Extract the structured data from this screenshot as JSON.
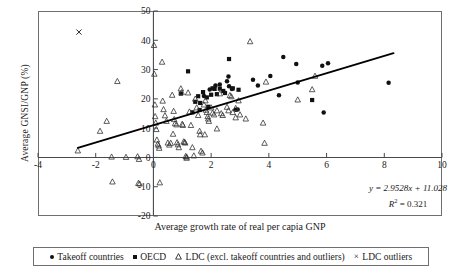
{
  "figure": {
    "y_axis_title": "Average GNSI/GNP (%)",
    "x_axis_title": "Average growth rate of real per capia GNP",
    "equation_line1": "y = 2.9528x + 11.028",
    "equation_r2_label": "R",
    "equation_r2_exp": "2",
    "equation_r2_value": " = 0.321"
  },
  "legend": {
    "items": [
      {
        "marker": "circle",
        "label": "Takeoff countries"
      },
      {
        "marker": "square",
        "label": "OECD"
      },
      {
        "marker": "triangle",
        "label": "LDC (excl. takeoff countries and outliers)"
      },
      {
        "marker": "cross",
        "label": "LDC outliers"
      }
    ]
  },
  "chart_data": {
    "type": "scatter",
    "title": "",
    "xlabel": "Average growth rate of real per capia GNP",
    "ylabel": "Average GNSI/GNP (%)",
    "xlim": [
      -4,
      10
    ],
    "ylim": [
      -20,
      50
    ],
    "xticks": [
      -4,
      -2,
      0,
      2,
      4,
      6,
      8,
      10
    ],
    "yticks": [
      -20,
      -10,
      0,
      10,
      20,
      30,
      40,
      50
    ],
    "xtick_labels": [
      "-4",
      "-2",
      "0",
      "2",
      "4",
      "6",
      "8",
      "10"
    ],
    "ytick_labels": [
      "-20",
      "-10",
      "0",
      "10",
      "20",
      "30",
      "40",
      "50"
    ],
    "grid": false,
    "legend_position": "below",
    "y_axis_at_x": 0,
    "x_axis_at_y": 0,
    "trendline": {
      "equation": "y = 2.9528x + 11.028",
      "slope": 2.9528,
      "intercept": 11.028,
      "r_squared": 0.321,
      "x_start": -2.62,
      "x_end": 8.32
    },
    "series": [
      {
        "name": "Takeoff countries",
        "marker": "filled-circle",
        "points": [
          [
            1.75,
            21.0
          ],
          [
            1.95,
            23.2
          ],
          [
            2.15,
            24.6
          ],
          [
            2.3,
            24.9
          ],
          [
            2.55,
            26.0
          ],
          [
            2.6,
            27.6
          ],
          [
            2.62,
            24.3
          ],
          [
            2.72,
            23.4
          ],
          [
            2.85,
            16.3
          ],
          [
            2.92,
            16.4
          ],
          [
            3.45,
            26.5
          ],
          [
            3.62,
            24.6
          ],
          [
            4.05,
            27.8
          ],
          [
            4.35,
            21.2
          ],
          [
            4.5,
            34.3
          ],
          [
            4.95,
            31.9
          ],
          [
            5.0,
            25.6
          ],
          [
            5.85,
            31.3
          ],
          [
            5.9,
            15.3
          ],
          [
            6.05,
            32.2
          ],
          [
            8.15,
            25.5
          ]
        ]
      },
      {
        "name": "OECD",
        "marker": "filled-square",
        "points": [
          [
            1.2,
            29.4
          ],
          [
            1.55,
            20.9
          ],
          [
            1.6,
            16.2
          ],
          [
            1.62,
            18.6
          ],
          [
            1.72,
            22.3
          ],
          [
            1.85,
            20.5
          ],
          [
            1.9,
            17.3
          ],
          [
            2.0,
            21.4
          ],
          [
            2.05,
            23.6
          ],
          [
            2.12,
            23.4
          ],
          [
            2.2,
            21.6
          ],
          [
            2.3,
            23.5
          ],
          [
            2.42,
            22.7
          ],
          [
            2.48,
            22.0
          ],
          [
            2.62,
            33.6
          ],
          [
            2.75,
            23.6
          ],
          [
            2.95,
            23.1
          ],
          [
            5.5,
            19.6
          ],
          [
            0.95,
            21.8
          ],
          [
            1.35,
            15.4
          ],
          [
            1.45,
            19.0
          ]
        ]
      },
      {
        "name": "LDC (excl. takeoff countries and outliers)",
        "marker": "open-triangle",
        "points": [
          [
            0.02,
            38.3
          ],
          [
            0.03,
            28.5
          ],
          [
            0.05,
            18.0
          ],
          [
            0.06,
            14.0
          ],
          [
            0.08,
            11.8
          ],
          [
            0.1,
            9.6
          ],
          [
            0.12,
            6.0
          ],
          [
            0.15,
            4.6
          ],
          [
            0.18,
            4.0
          ],
          [
            0.2,
            3.2
          ],
          [
            0.3,
            32.6
          ],
          [
            0.32,
            19.3
          ],
          [
            0.35,
            16.4
          ],
          [
            0.4,
            14.3
          ],
          [
            0.45,
            12.4
          ],
          [
            0.5,
            5.0
          ],
          [
            0.55,
            4.3
          ],
          [
            0.6,
            4.9
          ],
          [
            0.65,
            21.3
          ],
          [
            0.7,
            15.8
          ],
          [
            0.72,
            13.0
          ],
          [
            0.75,
            11.6
          ],
          [
            0.8,
            11.2
          ],
          [
            0.82,
            5.1
          ],
          [
            0.85,
            4.4
          ],
          [
            0.88,
            3.4
          ],
          [
            0.95,
            23.5
          ],
          [
            0.98,
            22.2
          ],
          [
            1.0,
            11.4
          ],
          [
            1.02,
            11.0
          ],
          [
            1.05,
            5.4
          ],
          [
            1.08,
            5.2
          ],
          [
            1.1,
            5.0
          ],
          [
            1.12,
            0.4
          ],
          [
            1.15,
            0.2
          ],
          [
            1.2,
            22.1
          ],
          [
            1.25,
            15.6
          ],
          [
            1.3,
            11.0
          ],
          [
            1.35,
            3.4
          ],
          [
            1.4,
            0.6
          ],
          [
            1.45,
            20.0
          ],
          [
            1.5,
            17.0
          ],
          [
            1.55,
            14.4
          ],
          [
            1.6,
            9.0
          ],
          [
            1.62,
            7.8
          ],
          [
            1.65,
            2.2
          ],
          [
            1.7,
            1.6
          ],
          [
            1.75,
            18.0
          ],
          [
            1.8,
            19.4
          ],
          [
            1.82,
            16.2
          ],
          [
            1.85,
            15.4
          ],
          [
            1.88,
            14.0
          ],
          [
            1.9,
            13.2
          ],
          [
            1.92,
            12.4
          ],
          [
            2.0,
            17.0
          ],
          [
            2.05,
            15.2
          ],
          [
            2.1,
            14.6
          ],
          [
            2.2,
            16.0
          ],
          [
            2.3,
            21.8
          ],
          [
            2.35,
            15.0
          ],
          [
            2.4,
            14.4
          ],
          [
            2.55,
            17.2
          ],
          [
            2.6,
            16.0
          ],
          [
            2.65,
            21.2
          ],
          [
            2.7,
            20.8
          ],
          [
            2.75,
            15.4
          ],
          [
            2.85,
            13.6
          ],
          [
            2.95,
            19.4
          ],
          [
            3.0,
            14.6
          ],
          [
            3.2,
            13.2
          ],
          [
            3.35,
            39.6
          ],
          [
            3.8,
            11.8
          ],
          [
            3.85,
            4.9
          ],
          [
            3.9,
            25.8
          ],
          [
            5.0,
            19.7
          ],
          [
            5.5,
            23.2
          ],
          [
            5.6,
            27.8
          ],
          [
            -2.62,
            2.3
          ],
          [
            -1.85,
            9.0
          ],
          [
            -1.62,
            12.4
          ],
          [
            -1.45,
            0.2
          ],
          [
            -1.42,
            -8.3
          ],
          [
            -1.25,
            26.0
          ],
          [
            -0.95,
            0.1
          ],
          [
            -0.55,
            0.3
          ],
          [
            -0.5,
            -0.6
          ],
          [
            -0.52,
            -8.8
          ],
          [
            -0.48,
            -9.0
          ],
          [
            0.22,
            -8.6
          ],
          [
            1.15,
            -0.2
          ],
          [
            2.85,
            16.8
          ],
          [
            0.68,
            8.0
          ],
          [
            1.78,
            7.8
          ],
          [
            2.2,
            9.8
          ]
        ]
      },
      {
        "name": "LDC outliers",
        "marker": "cross",
        "points": [
          [
            -2.58,
            42.8
          ]
        ]
      }
    ]
  }
}
